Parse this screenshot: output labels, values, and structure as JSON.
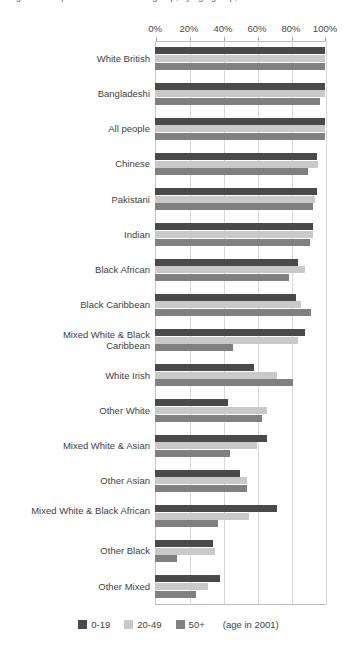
{
  "title_cutoff": "Figure 2:  Proportion of each ethnic group, by age group, born in the UK",
  "legend": {
    "items": [
      {
        "label": "0-19",
        "color": "#4a4a4a"
      },
      {
        "label": "20-49",
        "color": "#c9c9c9"
      },
      {
        "label": "50+",
        "color": "#808080"
      }
    ],
    "note": "(age in 2001)"
  },
  "chart_data": {
    "type": "bar",
    "orientation": "horizontal",
    "title": "",
    "xlabel": "",
    "ylabel": "",
    "xlim": [
      0,
      100
    ],
    "xticks": [
      "0%",
      "20%",
      "40%",
      "60%",
      "80%",
      "100%"
    ],
    "xtick_values": [
      0,
      20,
      40,
      60,
      80,
      100
    ],
    "grid": true,
    "legend_position": "bottom",
    "categories": [
      "White British",
      "Bangladeshi",
      "All people",
      "Chinese",
      "Pakistani",
      "Indian",
      "Black African",
      "Black Caribbean",
      "Mixed White & Black Caribbean",
      "White Irish",
      "Other White",
      "Mixed White & Asian",
      "Other Asian",
      "Mixed White & Black African",
      "Other Black",
      "Other Mixed"
    ],
    "series": [
      {
        "name": "0-19",
        "color": "#4a4a4a",
        "values": [
          100,
          100,
          100,
          95,
          95,
          93,
          84,
          83,
          88,
          58,
          43,
          66,
          50,
          72,
          34,
          38
        ]
      },
      {
        "name": "20-49",
        "color": "#c9c9c9",
        "values": [
          100,
          100,
          100,
          96,
          94,
          93,
          88,
          86,
          84,
          72,
          66,
          60,
          54,
          55,
          35,
          31
        ]
      },
      {
        "name": "50+",
        "color": "#808080",
        "values": [
          100,
          97,
          100,
          90,
          93,
          91,
          79,
          92,
          46,
          81,
          63,
          44,
          54,
          37,
          13,
          24
        ]
      }
    ]
  }
}
